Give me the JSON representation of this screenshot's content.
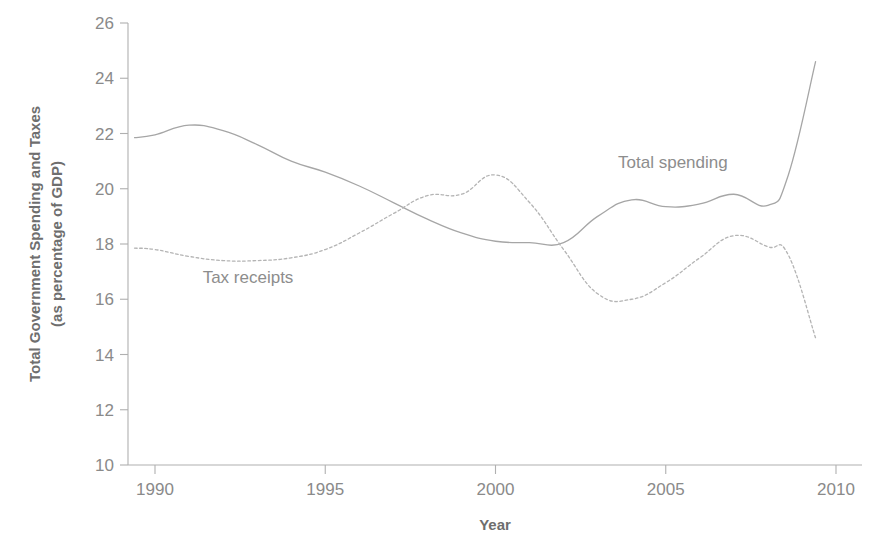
{
  "chart_data": {
    "type": "line",
    "title": "",
    "xlabel": "Year",
    "ylabel": "Total Government Spending and Taxes\n(as percentage of GDP)",
    "ylabel_line1": "Total Government Spending and Taxes",
    "ylabel_line2": "(as percentage of GDP)",
    "xlim": [
      1989,
      2010
    ],
    "ylim": [
      10,
      26
    ],
    "xticks": [
      1990,
      1995,
      2000,
      2005,
      2010
    ],
    "xtick_labels": [
      "1990",
      "1995",
      "2000",
      "2005",
      "2010"
    ],
    "yticks": [
      10,
      12,
      14,
      16,
      18,
      20,
      22,
      24,
      26
    ],
    "ytick_labels": [
      "10",
      "12",
      "14",
      "16",
      "18",
      "20",
      "22",
      "24",
      "26"
    ],
    "grid": false,
    "legend_position": "inline-annotation",
    "x": [
      1989.4,
      1990,
      1991,
      1992,
      1993,
      1994,
      1995,
      1996,
      1997,
      1998,
      1999,
      2000,
      2001,
      2002,
      2003,
      2004,
      2005,
      2006,
      2007,
      2008,
      2008.6,
      2009.4
    ],
    "series": [
      {
        "name": "Total spending",
        "style": "solid",
        "color": "#a6a6a6",
        "values": [
          21.85,
          21.95,
          22.3,
          22.1,
          21.6,
          21.0,
          20.6,
          20.1,
          19.5,
          18.9,
          18.4,
          18.1,
          18.05,
          18.05,
          19.0,
          19.6,
          19.35,
          19.45,
          19.8,
          19.4,
          20.5,
          24.6
        ]
      },
      {
        "name": "Tax receipts",
        "style": "dotted",
        "color": "#b4b4b4",
        "values": [
          17.85,
          17.8,
          17.55,
          17.4,
          17.4,
          17.5,
          17.8,
          18.4,
          19.1,
          19.75,
          19.8,
          20.5,
          19.5,
          17.8,
          16.2,
          16.0,
          16.6,
          17.5,
          18.3,
          17.9,
          17.6,
          14.6
        ]
      }
    ],
    "annotations": [
      {
        "text": "Tax receipts",
        "x": 1991.4,
        "y": 16.6,
        "name": "tax-receipts-label"
      },
      {
        "text": "Total spending",
        "x": 2003.6,
        "y": 20.75,
        "name": "total-spending-label"
      }
    ]
  },
  "axes": {
    "x_axis_title": "Year",
    "y_axis_title_line1": "Total Government Spending and Taxes",
    "y_axis_title_line2": "(as percentage of GDP)"
  },
  "colors": {
    "axis": "#b0b0b0",
    "tick_text": "#8a8a8a",
    "spending_line": "#a6a6a6",
    "tax_line": "#b4b4b4",
    "background": "#ffffff"
  }
}
